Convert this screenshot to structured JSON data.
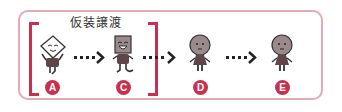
{
  "title": "仮装譲渡",
  "colors": {
    "frame": "#e6a9b6",
    "bracket": "#c8304e",
    "badge": "#c8304e",
    "figure_body": "#5e4648",
    "figure_head_gray": "#9a8a8c",
    "arrow": "#222222"
  },
  "figures": [
    {
      "id": "A",
      "label": "A",
      "head": "paper-envelope",
      "expression": "smiling"
    },
    {
      "id": "C",
      "label": "C",
      "head": "box",
      "expression": "laughing"
    },
    {
      "id": "D",
      "label": "D",
      "head": "round",
      "expression": "neutral"
    },
    {
      "id": "E",
      "label": "E",
      "head": "round",
      "expression": "neutral"
    }
  ],
  "arrows": [
    {
      "from": "A",
      "to": "C",
      "style": "dotted"
    },
    {
      "from": "C",
      "to": "D",
      "style": "dotted"
    },
    {
      "from": "D",
      "to": "E",
      "style": "dotted"
    }
  ],
  "bracket_group": {
    "label": "仮装譲渡",
    "members": [
      "A",
      "C"
    ]
  }
}
